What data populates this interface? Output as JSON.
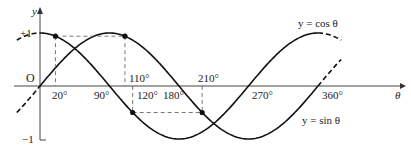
{
  "chart_data": {
    "type": "line",
    "title": "",
    "xlabel": "θ",
    "ylabel": "y",
    "xlim": [
      -30,
      400
    ],
    "ylim": [
      -1,
      1
    ],
    "x_units": "degrees",
    "series": [
      {
        "name": "y = sin θ",
        "function": "sin",
        "x": [
          0,
          90,
          180,
          270,
          360
        ],
        "values": [
          0,
          1,
          0,
          -1,
          0
        ]
      },
      {
        "name": "y = cos θ",
        "function": "cos",
        "x": [
          0,
          90,
          180,
          270,
          360
        ],
        "values": [
          1,
          0,
          -1,
          0,
          1
        ]
      }
    ],
    "x_tick_labels": [
      "20°",
      "90°",
      "110°",
      "120°",
      "180°",
      "210°",
      "270°",
      "360°"
    ],
    "y_tick_labels": [
      "+1",
      "O",
      "−1"
    ],
    "marked_points": [
      {
        "theta": 20,
        "curve": "cos",
        "y": 0.94
      },
      {
        "theta": 110,
        "curve": "sin",
        "y": 0.94
      },
      {
        "theta": 120,
        "curve": "cos",
        "y": -0.5
      },
      {
        "theta": 210,
        "curve": "sin",
        "y": -0.5
      }
    ],
    "annotations": [
      "y = cos θ",
      "y = sin θ"
    ],
    "grid": false,
    "legend": "inline labels"
  },
  "labels": {
    "y_axis": "y",
    "x_axis": "θ",
    "plus_one": "+1",
    "origin": "O",
    "minus_one": "−1",
    "t20": "20°",
    "t90": "90°",
    "t110": "110°",
    "t120": "120°",
    "t180": "180°",
    "t210": "210°",
    "t270": "270°",
    "t360": "360°",
    "cos_label": "y = cos θ",
    "sin_label": "y = sin θ"
  }
}
